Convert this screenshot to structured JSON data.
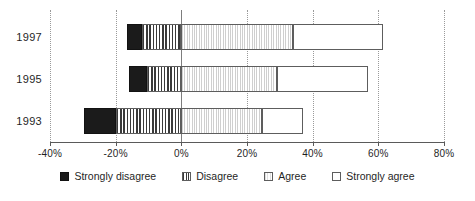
{
  "chart_data": {
    "type": "bar",
    "orientation": "horizontal",
    "stacked": true,
    "diverging": true,
    "title": "",
    "subtitle": "",
    "xlabel": "",
    "ylabel": "",
    "categories": [
      "1997",
      "1995",
      "1993"
    ],
    "series": [
      {
        "name": "Strongly disagree",
        "values": [
          -4.5,
          -5.5,
          -9.5
        ]
      },
      {
        "name": "Disagree",
        "values": [
          -12.0,
          -10.5,
          -20.0
        ]
      },
      {
        "name": "Agree",
        "values": [
          34.0,
          29.0,
          24.5
        ]
      },
      {
        "name": "Strongly agree",
        "values": [
          27.5,
          28.0,
          12.5
        ]
      }
    ],
    "xlim": [
      -40,
      80
    ],
    "xticks": [
      -40,
      -20,
      0,
      20,
      40,
      60,
      80
    ],
    "xtick_labels": [
      "-40%",
      "-20%",
      "0%",
      "20%",
      "40%",
      "60%",
      "80%"
    ],
    "grid": true,
    "grid_axis": "x",
    "legend_position": "bottom",
    "legend": [
      "Strongly disagree",
      "Disagree",
      "Agree",
      "Strongly agree"
    ],
    "annotations": []
  },
  "axis": {
    "ticks": [
      {
        "value": -40,
        "label": "-40%"
      },
      {
        "value": -20,
        "label": "-20%"
      },
      {
        "value": 0,
        "label": "0%"
      },
      {
        "value": 20,
        "label": "20%"
      },
      {
        "value": 40,
        "label": "40%"
      },
      {
        "value": 60,
        "label": "60%"
      },
      {
        "value": 80,
        "label": "80%"
      }
    ]
  },
  "rows": [
    {
      "year": "1997",
      "segments": [
        {
          "key": "strongly-disagree",
          "start": -16.5,
          "end": -12.0
        },
        {
          "key": "disagree",
          "start": -12.0,
          "end": 0.0
        },
        {
          "key": "agree",
          "start": 0.0,
          "end": 34.0
        },
        {
          "key": "strongly-agree",
          "start": 34.0,
          "end": 61.5
        }
      ]
    },
    {
      "year": "1995",
      "segments": [
        {
          "key": "strongly-disagree",
          "start": -16.0,
          "end": -10.5
        },
        {
          "key": "disagree",
          "start": -10.5,
          "end": 0.0
        },
        {
          "key": "agree",
          "start": 0.0,
          "end": 29.0
        },
        {
          "key": "strongly-agree",
          "start": 29.0,
          "end": 57.0
        }
      ]
    },
    {
      "year": "1993",
      "segments": [
        {
          "key": "strongly-disagree",
          "start": -29.5,
          "end": -20.0
        },
        {
          "key": "disagree",
          "start": -20.0,
          "end": 0.0
        },
        {
          "key": "agree",
          "start": 0.0,
          "end": 24.5
        },
        {
          "key": "strongly-agree",
          "start": 24.5,
          "end": 37.0
        }
      ]
    }
  ],
  "legend": {
    "items": [
      {
        "key": "strongly-disagree",
        "label": "Strongly disagree"
      },
      {
        "key": "disagree",
        "label": "Disagree"
      },
      {
        "key": "agree",
        "label": "Agree"
      },
      {
        "key": "strongly-agree",
        "label": "Strongly agree"
      }
    ]
  },
  "colors": {
    "strongly_disagree": "#1b1b1b",
    "disagree": "#3a3a3a",
    "agree": "#cfcfcf",
    "strongly_agree": "#ffffff",
    "axis": "#5a5a5a",
    "grid": "#9a9a9a"
  }
}
